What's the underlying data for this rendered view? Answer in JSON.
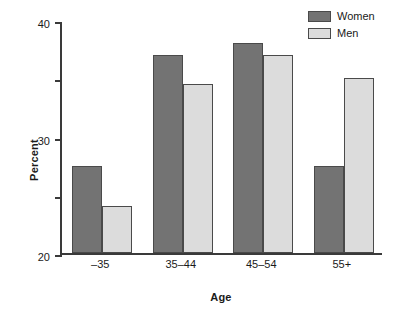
{
  "chart_data": {
    "type": "bar",
    "title": "",
    "xlabel": "Age",
    "ylabel": "Percent",
    "categories": [
      "–35",
      "35–44",
      "45–54",
      "55+"
    ],
    "series": [
      {
        "name": "Women",
        "color": "#737373",
        "values": [
          15,
          34,
          36,
          15
        ]
      },
      {
        "name": "Men",
        "color": "#dcdcdc",
        "values": [
          8,
          29,
          34,
          30
        ]
      }
    ],
    "ylim": [
      0,
      40
    ],
    "ytick_values": [
      0,
      10,
      20,
      30,
      40
    ],
    "ytick_labels": [
      "0",
      "10",
      "20",
      "30",
      "40"
    ],
    "grid": false,
    "legend_position": "top-right",
    "axis_color": "#3a3a3a",
    "bar_border_color": "#4a4a4a",
    "background": "#ffffff"
  }
}
